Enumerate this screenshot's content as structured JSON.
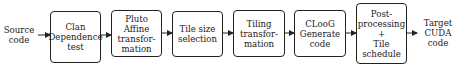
{
  "input": {
    "lines": [
      "Source",
      "code"
    ]
  },
  "output": {
    "lines": [
      "Target",
      "CUDA",
      "code"
    ]
  },
  "stages": [
    {
      "id": "clan",
      "lines": [
        "Clan",
        "Dependence",
        "test"
      ]
    },
    {
      "id": "pluto",
      "lines": [
        "Pluto",
        "Affine",
        "transfor-",
        "mation"
      ]
    },
    {
      "id": "tile-size",
      "lines": [
        "Tile size",
        "selection"
      ]
    },
    {
      "id": "tiling",
      "lines": [
        "Tiling",
        "transfor-",
        "mation"
      ]
    },
    {
      "id": "cloog",
      "lines": [
        "CLooG",
        "Generate",
        "code"
      ]
    },
    {
      "id": "post",
      "lines": [
        "Post-",
        "processing",
        "+",
        "Tile",
        "schedule"
      ]
    }
  ]
}
